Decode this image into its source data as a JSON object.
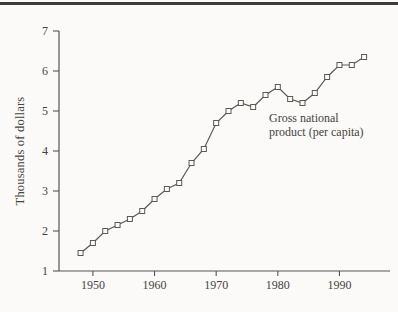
{
  "figure": {
    "ylabel": "Thousands of dollars",
    "annotation": {
      "line1": "Gross national",
      "line2": "product (per capita)"
    }
  },
  "chart_data": {
    "type": "line",
    "series_name": "Gross national product (per capita)",
    "ylabel": "Thousands of dollars",
    "x": [
      1948,
      1950,
      1952,
      1954,
      1956,
      1958,
      1960,
      1962,
      1964,
      1966,
      1968,
      1970,
      1972,
      1974,
      1976,
      1978,
      1980,
      1982,
      1984,
      1986,
      1988,
      1990,
      1992,
      1994
    ],
    "values": [
      1.45,
      1.7,
      2.0,
      2.15,
      2.3,
      2.5,
      2.8,
      3.05,
      3.2,
      3.7,
      4.05,
      4.7,
      5.0,
      5.2,
      5.1,
      5.4,
      5.6,
      5.3,
      5.2,
      5.45,
      5.85,
      6.15,
      6.15,
      6.35
    ],
    "x_ticks": [
      1950,
      1960,
      1970,
      1980,
      1990
    ],
    "y_ticks": [
      1,
      2,
      3,
      4,
      5,
      6,
      7
    ],
    "xlim": [
      1944.5,
      1998.2
    ],
    "ylim": [
      1,
      7
    ],
    "grid": false,
    "legend": "none",
    "marker": "open-square",
    "annotation": {
      "line1": "Gross national",
      "line2": "product (per capita)"
    },
    "colors": {
      "line": "#5b5954",
      "marker_fill": "#fbfaf8",
      "axis": "#56544f",
      "text": "#45433e",
      "background": "#fbfaf8",
      "top_rule": "#3d3c3a"
    }
  }
}
